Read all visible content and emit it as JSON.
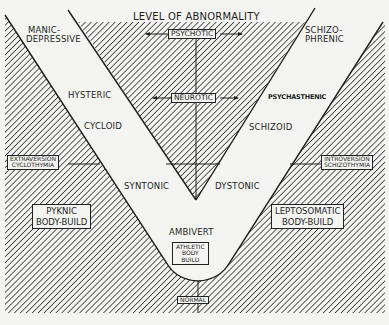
{
  "diagram": {
    "title": "LEVEL OF ABNORMALITY",
    "axis_labels": {
      "psychotic": "PSYCHOTIC",
      "neurotic": "NEUROTIC",
      "normal": "NORMAL"
    },
    "left_side": {
      "top": [
        "MANIC-",
        "DEPRESSIVE"
      ],
      "neurotic_level": "HYSTERIC",
      "trait": "CYCLOID",
      "near_apex": "SYNTONIC",
      "dimension_box": [
        "EXTRAVERSION",
        "CYCLOTHYMIA"
      ],
      "body_build_box": [
        "PYKNIC",
        "BODY-BUILD"
      ]
    },
    "right_side": {
      "top": [
        "SCHIZO-",
        "PHRENIC"
      ],
      "neurotic_level": "PSYCHASTHENIC",
      "trait": "SCHIZOID",
      "near_apex": "DYSTONIC",
      "dimension_box": [
        "INTROVERSION",
        "SCHIZOTHYMIA"
      ],
      "body_build_box": [
        "LEPTOSOMATIC",
        "BODY-BUILD"
      ]
    },
    "center": {
      "middle": "AMBIVERT",
      "body_build_box": [
        "ATHLETIC",
        "BODY",
        "BUILD"
      ]
    },
    "colors": {
      "ink": "#1e1e1e",
      "paper": "#f4f4f2"
    }
  }
}
